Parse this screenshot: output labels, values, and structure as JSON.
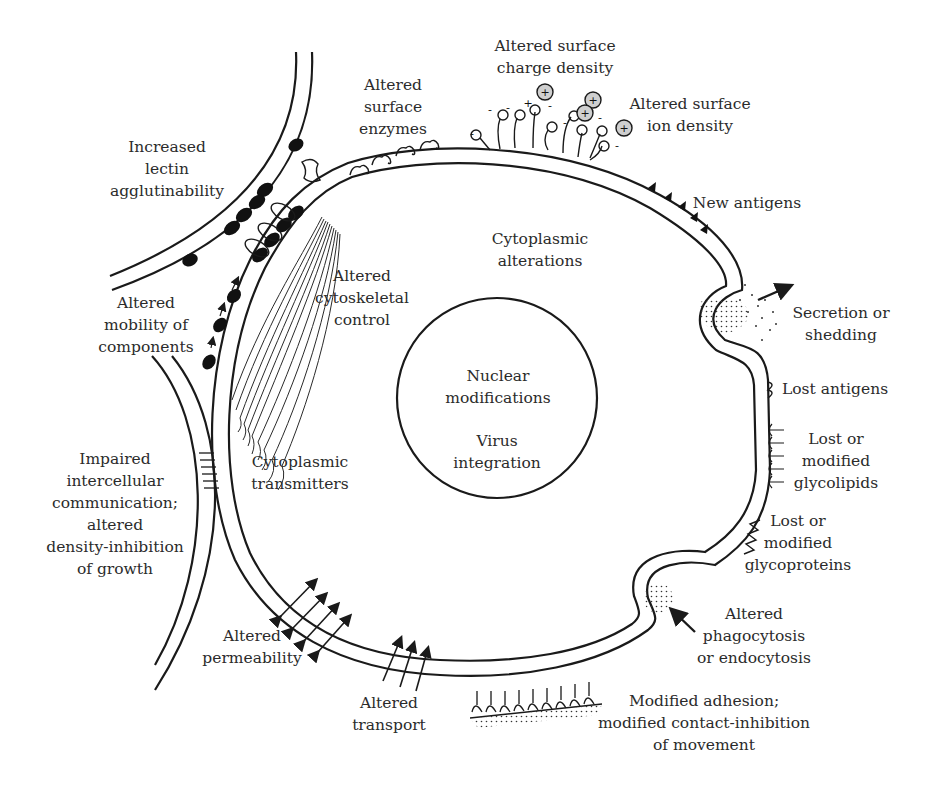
{
  "colors": {
    "ink": "#1a1a1a",
    "text": "#2b2b2b",
    "background": "#ffffff",
    "ion": "#bdbdbd"
  },
  "labels": {
    "increased_lectin": {
      "lines": [
        "Increased",
        "lectin",
        "agglutinability"
      ],
      "x": 167,
      "y": 136
    },
    "altered_surface_enzymes": {
      "lines": [
        "Altered",
        "surface",
        "enzymes"
      ],
      "x": 393,
      "y": 74
    },
    "altered_surface_charge": {
      "lines": [
        "Altered surface",
        "charge density"
      ],
      "x": 555,
      "y": 35
    },
    "altered_surface_ion": {
      "lines": [
        "Altered surface",
        "ion density"
      ],
      "x": 690,
      "y": 93
    },
    "new_antigens": {
      "lines": [
        "New antigens"
      ],
      "x": 747,
      "y": 192
    },
    "cytoplasmic_alterations": {
      "lines": [
        "Cytoplasmic",
        "alterations"
      ],
      "x": 540,
      "y": 228
    },
    "altered_mobility": {
      "lines": [
        "Altered",
        "mobility of",
        "components"
      ],
      "x": 146,
      "y": 292
    },
    "altered_cytoskeletal": {
      "lines": [
        "Altered",
        "cytoskeletal",
        "control"
      ],
      "x": 362,
      "y": 265
    },
    "secretion": {
      "lines": [
        "Secretion or",
        "shedding"
      ],
      "x": 841,
      "y": 302
    },
    "nuclear_modifications": {
      "lines": [
        "Nuclear",
        "modifications"
      ],
      "x": 498,
      "y": 365
    },
    "virus_integration": {
      "lines": [
        "Virus",
        "integration"
      ],
      "x": 497,
      "y": 430
    },
    "lost_antigens": {
      "lines": [
        "Lost antigens"
      ],
      "x": 835,
      "y": 378
    },
    "lost_glycolipids": {
      "lines": [
        "Lost or",
        "modified",
        "glycolipids"
      ],
      "x": 836,
      "y": 428
    },
    "lost_glycoproteins": {
      "lines": [
        "Lost or",
        "modified",
        "glycoproteins"
      ],
      "x": 798,
      "y": 510
    },
    "impaired_communication": {
      "lines": [
        "Impaired",
        "intercellular",
        "communication;",
        "altered",
        "density-inhibition",
        "of growth"
      ],
      "x": 115,
      "y": 448
    },
    "cytoplasmic_transmitters": {
      "lines": [
        "Cytoplasmic",
        "transmitters"
      ],
      "x": 300,
      "y": 451
    },
    "altered_permeability": {
      "lines": [
        "Altered",
        "permeability"
      ],
      "x": 252,
      "y": 625
    },
    "altered_phagocytosis": {
      "lines": [
        "Altered",
        "phagocytosis",
        "or endocytosis"
      ],
      "x": 754,
      "y": 603
    },
    "altered_transport": {
      "lines": [
        "Altered",
        "transport"
      ],
      "x": 389,
      "y": 692
    },
    "modified_adhesion": {
      "lines": [
        "Modified adhesion;",
        "modified contact-inhibition",
        "of movement"
      ],
      "x": 704,
      "y": 690
    }
  },
  "charges": {
    "ions": [
      {
        "x": 545,
        "y": 92,
        "sign": "+"
      },
      {
        "x": 593,
        "y": 100,
        "sign": "+"
      },
      {
        "x": 585,
        "y": 113,
        "sign": "+"
      },
      {
        "x": 624,
        "y": 128,
        "sign": "+"
      }
    ],
    "signs": [
      {
        "x": 490,
        "y": 140,
        "t": "-"
      },
      {
        "x": 509,
        "y": 111,
        "t": "-"
      },
      {
        "x": 508,
        "y": 110,
        "t": ""
      },
      {
        "x": 525,
        "y": 110,
        "t": "+"
      },
      {
        "x": 550,
        "y": 108,
        "t": "-"
      },
      {
        "x": 565,
        "y": 128,
        "t": "-"
      },
      {
        "x": 601,
        "y": 122,
        "t": "-"
      },
      {
        "x": 618,
        "y": 152,
        "t": "-"
      },
      {
        "x": 470,
        "y": 140,
        "t": "-"
      },
      {
        "x": 494,
        "y": 112,
        "t": "-"
      }
    ]
  }
}
